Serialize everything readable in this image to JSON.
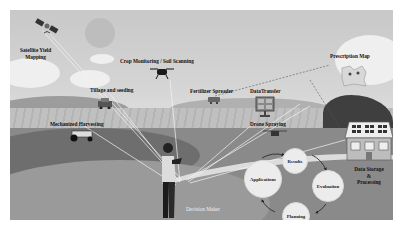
{
  "diagram": {
    "title_hidden": "",
    "nodes": [
      {
        "id": "satellite",
        "label": "Satellite Yield\nMapping",
        "icon": "satellite-icon"
      },
      {
        "id": "crop_monitoring",
        "label": "Crop Monitoring / Soil Scanning",
        "icon": "drone-icon"
      },
      {
        "id": "tillage",
        "label": "Tillage and seeding",
        "icon": "seeder-icon"
      },
      {
        "id": "fertilizer",
        "label": "Fertilizer Spreader",
        "icon": "spreader-icon"
      },
      {
        "id": "data_transfer",
        "label": "DataTransfer",
        "icon": "server-icon"
      },
      {
        "id": "prescription_map",
        "label": "Prescription Map",
        "icon": "map-icon"
      },
      {
        "id": "mechanized_harvesting",
        "label": "Mechanized Harvesting",
        "icon": "harvester-icon"
      },
      {
        "id": "drone_spraying",
        "label": "Drone Spraying",
        "icon": "spray-drone-icon"
      },
      {
        "id": "data_storage",
        "label": "Data Storage\n&\nProcessing",
        "icon": "solar-house-icon"
      },
      {
        "id": "decision_maker",
        "label": "Decision Maker",
        "icon": "farmer-icon"
      }
    ],
    "cycle": {
      "steps": [
        "Results",
        "Evaluation",
        "Planning",
        "Applications"
      ]
    },
    "edges": [
      [
        "satellite",
        "decision_maker"
      ],
      [
        "crop_monitoring",
        "decision_maker"
      ],
      [
        "tillage",
        "decision_maker"
      ],
      [
        "fertilizer",
        "prescription_map"
      ],
      [
        "data_transfer",
        "decision_maker"
      ],
      [
        "prescription_map",
        "decision_maker"
      ],
      [
        "mechanized_harvesting",
        "decision_maker"
      ],
      [
        "drone_spraying",
        "decision_maker"
      ],
      [
        "data_storage",
        "decision_maker"
      ]
    ],
    "colors": {
      "sky": "#d0d0d0",
      "field": "#b8b8b8",
      "meadow": "#8a8a8a",
      "connector": "#ffffff",
      "cycle_node": "#ececec"
    }
  }
}
